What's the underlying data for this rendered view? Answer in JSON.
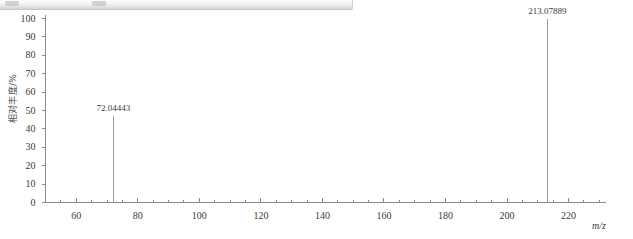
{
  "window": {
    "chrome_strip": "window-title-strip"
  },
  "chart_data": {
    "type": "bar",
    "title": "",
    "subtitle": "",
    "xlabel": "m/z",
    "ylabel": "相对丰度/%",
    "xlim": [
      50,
      232
    ],
    "ylim": [
      0,
      100
    ],
    "grid": false,
    "legend": false,
    "x_major_ticks": [
      60,
      80,
      100,
      120,
      140,
      160,
      180,
      200,
      220
    ],
    "x_major_tick_labels": [
      "60",
      "80",
      "100",
      "120",
      "140",
      "160",
      "180",
      "200",
      "220"
    ],
    "x_minor_tick_step": 5,
    "y_major_ticks": [
      0,
      10,
      20,
      30,
      40,
      50,
      60,
      70,
      80,
      90,
      100
    ],
    "y_major_tick_labels": [
      "0",
      "10",
      "20",
      "30",
      "40",
      "50",
      "60",
      "70",
      "80",
      "90",
      "100"
    ],
    "x": [
      72.04443,
      213.07889
    ],
    "values": [
      47,
      100
    ],
    "annotations": [
      {
        "text": "72.04443",
        "x": 72.04443,
        "y": 47
      },
      {
        "text": "213.07889",
        "x": 213.07889,
        "y": 100
      }
    ],
    "series": [
      {
        "name": "mass spectrum",
        "points": [
          {
            "mz": "72.04443",
            "intensity": 47
          },
          {
            "mz": "213.07889",
            "intensity": 100
          }
        ]
      }
    ],
    "colors": {
      "axis": "#8a8a8a",
      "peak": "#9a9a9a",
      "text": "#3a3a3a",
      "background": "#ffffff"
    }
  }
}
